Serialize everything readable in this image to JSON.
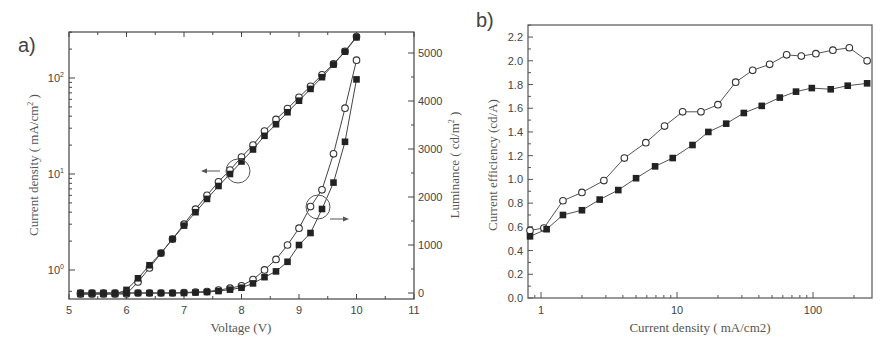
{
  "chart_data": [
    {
      "panel": "a)",
      "type": "line",
      "xlabel": "Voltage (V)",
      "ylabel_left": "Current density ( mA/cm2 )",
      "ylabel_right": "Luminance ( cd/m2 )",
      "xlim": [
        5,
        11
      ],
      "xticks": [
        "5",
        "6",
        "7",
        "8",
        "9",
        "10",
        "11"
      ],
      "ylim_left_log": [
        0.55,
        300
      ],
      "yticks_left": [
        "10^0",
        "10^1",
        "10^2"
      ],
      "ylim_right": [
        -100,
        5400
      ],
      "yticks_right": [
        "0",
        "1000",
        "2000",
        "3000",
        "4000",
        "5000"
      ],
      "annotations": [
        "circle + left arrow on current density curves near 7.9 V",
        "circle + right arrow on luminance curves near 9.4 V"
      ],
      "x": [
        5.2,
        5.4,
        5.6,
        5.8,
        6.0,
        6.2,
        6.4,
        6.6,
        6.8,
        7.0,
        7.2,
        7.4,
        7.6,
        7.8,
        8.0,
        8.2,
        8.4,
        8.6,
        8.8,
        9.0,
        9.2,
        9.4,
        9.6,
        9.8,
        10.0
      ],
      "series": [
        {
          "name": "Current density (open circle)",
          "axis": "left",
          "marker": "circle-open",
          "values": [
            0.55,
            0.55,
            0.55,
            0.55,
            0.55,
            0.75,
            1.05,
            1.5,
            2.1,
            3.0,
            4.3,
            6.0,
            8.3,
            11,
            15,
            20,
            28,
            37,
            48,
            63,
            82,
            108,
            140,
            190,
            270
          ]
        },
        {
          "name": "Current density (filled square)",
          "axis": "left",
          "marker": "square-filled",
          "values": [
            0.55,
            0.55,
            0.55,
            0.55,
            0.62,
            0.82,
            1.12,
            1.5,
            2.1,
            2.9,
            4.0,
            5.5,
            7.5,
            10,
            13.5,
            18,
            25,
            33,
            44,
            58,
            77,
            102,
            138,
            188,
            265
          ]
        },
        {
          "name": "Luminance (open circle)",
          "axis": "right",
          "marker": "circle-open",
          "values": [
            0,
            0,
            0,
            0,
            0,
            0,
            0,
            0,
            0,
            10,
            20,
            30,
            60,
            100,
            150,
            280,
            480,
            700,
            1000,
            1350,
            1800,
            2150,
            2900,
            3850,
            4850
          ]
        },
        {
          "name": "Luminance (filled square)",
          "axis": "right",
          "marker": "square-filled",
          "values": [
            0,
            0,
            0,
            0,
            0,
            0,
            0,
            0,
            0,
            0,
            10,
            20,
            40,
            70,
            110,
            200,
            330,
            450,
            650,
            1000,
            1250,
            1750,
            2300,
            3150,
            4450
          ]
        }
      ]
    },
    {
      "panel": "b)",
      "type": "line",
      "xlabel": "Current density ( mA/cm2)",
      "ylabel": "Current efficiency (cd/A)",
      "ghost_label": "Luminance ( cd/m2 )",
      "xscale": "log",
      "xlim": [
        0.8,
        260
      ],
      "xticks": [
        "1",
        "10",
        "100"
      ],
      "ylim": [
        0.0,
        2.3
      ],
      "yticks": [
        "0.0",
        "0.2",
        "0.4",
        "0.6",
        "0.8",
        "1.0",
        "1.2",
        "1.4",
        "1.6",
        "1.8",
        "2.0",
        "2.2"
      ],
      "series": [
        {
          "name": "open circle",
          "marker": "circle-open",
          "x": [
            0.82,
            1.05,
            1.45,
            2.0,
            2.9,
            4.1,
            5.9,
            8.1,
            11,
            15,
            20,
            27,
            36,
            48,
            64,
            82,
            105,
            140,
            185,
            250
          ],
          "values": [
            0.57,
            0.59,
            0.82,
            0.89,
            0.99,
            1.18,
            1.31,
            1.45,
            1.57,
            1.57,
            1.63,
            1.82,
            1.92,
            1.97,
            2.05,
            2.04,
            2.06,
            2.09,
            2.11,
            2.0
          ]
        },
        {
          "name": "filled square",
          "marker": "square-filled",
          "x": [
            0.82,
            1.1,
            1.45,
            2.0,
            2.7,
            3.7,
            5.0,
            6.9,
            9.3,
            13,
            17,
            23,
            31,
            42,
            57,
            75,
            98,
            135,
            180,
            250
          ],
          "values": [
            0.52,
            0.58,
            0.7,
            0.74,
            0.83,
            0.91,
            1.01,
            1.11,
            1.18,
            1.29,
            1.4,
            1.47,
            1.56,
            1.62,
            1.69,
            1.74,
            1.77,
            1.76,
            1.79,
            1.81
          ]
        }
      ]
    }
  ]
}
